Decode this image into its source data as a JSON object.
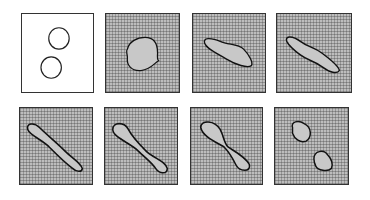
{
  "figure": {
    "rows": 2,
    "cols": 4,
    "panels": [
      {
        "index": 1,
        "row": 1,
        "col": 1,
        "state": "two separate circular drops",
        "background": "plain"
      },
      {
        "index": 2,
        "row": 1,
        "col": 2,
        "state": "coalesced single drop",
        "background": "hatched"
      },
      {
        "index": 3,
        "row": 1,
        "col": 3,
        "state": "elongated drop along diagonal",
        "background": "hatched"
      },
      {
        "index": 4,
        "row": 1,
        "col": 4,
        "state": "further elongated drop",
        "background": "hatched"
      },
      {
        "index": 5,
        "row": 2,
        "col": 1,
        "state": "long slender drop with bulbous ends",
        "background": "hatched"
      },
      {
        "index": 6,
        "row": 2,
        "col": 2,
        "state": "necking drop",
        "background": "hatched"
      },
      {
        "index": 7,
        "row": 2,
        "col": 3,
        "state": "pinching drop (figure-eight)",
        "background": "hatched"
      },
      {
        "index": 8,
        "row": 2,
        "col": 4,
        "state": "two separated drops",
        "background": "hatched"
      }
    ]
  }
}
